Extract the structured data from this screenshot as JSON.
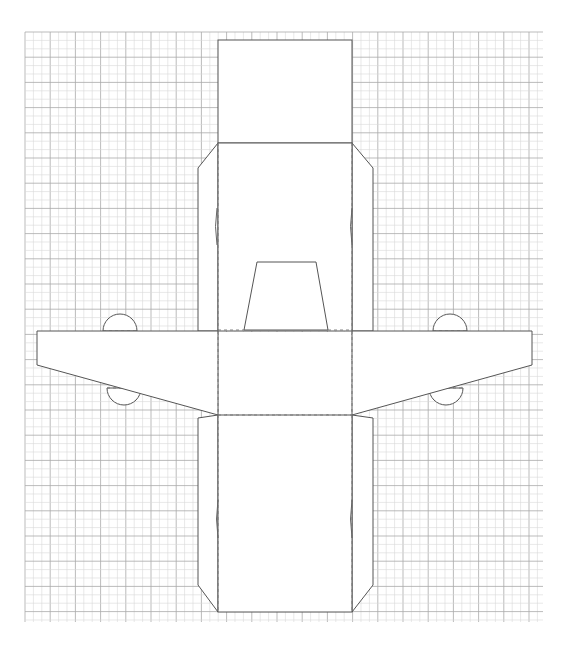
{
  "diagram": {
    "type": "papercraft-template",
    "colors": {
      "background": "#ffffff",
      "grid_minor": "#d8d8d8",
      "grid_major": "#a9a9a9",
      "cut_line": "#555555",
      "fold_line": "#777777",
      "piece_fill": "#ffffff"
    },
    "grid": {
      "x0": 25,
      "y0": 32,
      "x1": 543,
      "y1": 622,
      "spacing": 8.4
    },
    "pieces": {
      "fuselage_top_panel": {
        "x": 218,
        "y": 40,
        "w": 134,
        "h": 103
      },
      "fuselage_upper_body": {
        "x": 218,
        "y": 143,
        "w": 134,
        "h": 188
      },
      "left_upper_side_tab": [
        [
          218,
          143
        ],
        [
          198,
          168
        ],
        [
          198,
          331
        ],
        [
          218,
          331
        ]
      ],
      "right_upper_side_tab": [
        [
          352,
          143
        ],
        [
          373,
          168
        ],
        [
          373,
          331
        ],
        [
          352,
          331
        ]
      ],
      "tail_fin": [
        [
          244,
          330
        ],
        [
          257,
          262
        ],
        [
          316,
          262
        ],
        [
          328,
          330
        ]
      ],
      "left_wing": [
        [
          218,
          331
        ],
        [
          37,
          331
        ],
        [
          37,
          365
        ],
        [
          218,
          415
        ]
      ],
      "right_wing": [
        [
          352,
          331
        ],
        [
          532,
          331
        ],
        [
          532,
          365
        ],
        [
          352,
          415
        ]
      ],
      "fuselage_lower_body": {
        "x": 218,
        "y": 415,
        "w": 134,
        "h": 197
      },
      "left_lower_side_tab": [
        [
          218,
          415
        ],
        [
          198,
          418
        ],
        [
          198,
          585
        ],
        [
          218,
          612
        ]
      ],
      "right_lower_side_tab": [
        [
          352,
          415
        ],
        [
          373,
          418
        ],
        [
          373,
          585
        ],
        [
          352,
          612
        ]
      ]
    },
    "fold_lines": [
      {
        "name": "left-upper-fold",
        "x1": 218,
        "y1": 143,
        "x2": 218,
        "y2": 331
      },
      {
        "name": "right-upper-fold",
        "x1": 352,
        "y1": 143,
        "x2": 352,
        "y2": 331
      },
      {
        "name": "tail-base-left-fold",
        "x1": 218,
        "y1": 330,
        "x2": 244,
        "y2": 330
      },
      {
        "name": "tail-base-right-fold",
        "x1": 328,
        "y1": 330,
        "x2": 352,
        "y2": 330
      },
      {
        "name": "wing-root-left-fold",
        "x1": 218,
        "y1": 331,
        "x2": 218,
        "y2": 415
      },
      {
        "name": "wing-root-right-fold",
        "x1": 352,
        "y1": 331,
        "x2": 352,
        "y2": 415
      },
      {
        "name": "lower-body-top-fold",
        "x1": 218,
        "y1": 415,
        "x2": 352,
        "y2": 415
      },
      {
        "name": "left-lower-fold",
        "x1": 218,
        "y1": 415,
        "x2": 218,
        "y2": 612
      },
      {
        "name": "right-lower-fold",
        "x1": 352,
        "y1": 415,
        "x2": 352,
        "y2": 612
      }
    ],
    "slits": [
      {
        "name": "upper-left-slit",
        "x": 217,
        "y1": 208,
        "y2": 245
      },
      {
        "name": "upper-right-slit",
        "x": 352,
        "y1": 208,
        "y2": 245
      },
      {
        "name": "lower-left-slit",
        "x": 218,
        "y1": 500,
        "y2": 538
      },
      {
        "name": "lower-right-slit",
        "x": 352,
        "y1": 500,
        "y2": 538
      }
    ],
    "semicircle_tabs": [
      {
        "name": "left-wing-top-tab",
        "cx": 120,
        "cy": 331,
        "r": 17,
        "side": "up"
      },
      {
        "name": "right-wing-top-tab",
        "cx": 450,
        "cy": 331,
        "r": 17,
        "side": "up"
      },
      {
        "name": "left-wing-bottom-tab",
        "cx": 124,
        "cy": 388,
        "r": 17,
        "side": "down"
      },
      {
        "name": "right-wing-bottom-tab",
        "cx": 446,
        "cy": 388,
        "r": 17,
        "side": "down"
      }
    ]
  }
}
